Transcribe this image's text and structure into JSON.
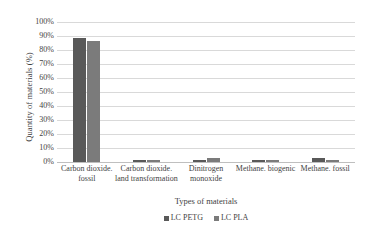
{
  "chart_data": {
    "type": "bar",
    "title": "",
    "xlabel": "Types of materials",
    "ylabel": "Quantity of materials (%)",
    "ylim": [
      0,
      100
    ],
    "y_tick_labels": [
      "100%",
      "90%",
      "80%",
      "70%",
      "60%",
      "50%",
      "40%",
      "30%",
      "20%",
      "10%",
      "0%"
    ],
    "y_tick_values": [
      100,
      90,
      80,
      70,
      60,
      50,
      40,
      30,
      20,
      10,
      0
    ],
    "grid": true,
    "legend_position": "bottom",
    "categories": [
      "Carbon dioxide. fossil",
      "Carbon dioxide. land transformation",
      "Dinitrogen monoxide",
      "Methane. biogenic",
      "Methane. fossil"
    ],
    "series": [
      {
        "name": "LC PETG",
        "color": "#595959",
        "values": [
          88.5,
          1.3,
          1.2,
          1.3,
          2.6
        ]
      },
      {
        "name": "LC PLA",
        "color": "#7b7b7b",
        "values": [
          86.5,
          1.5,
          3.0,
          1.1,
          1.6
        ]
      }
    ]
  },
  "legend": {
    "items": [
      {
        "label": "LC PETG",
        "marker": "square-marker"
      },
      {
        "label": "LC PLA",
        "marker": "square-marker"
      }
    ]
  }
}
